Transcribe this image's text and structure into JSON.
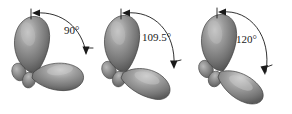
{
  "figure": {
    "background_color": "#ffffff",
    "lobe_color_mid": "#8a8a8a",
    "lobe_color_light": "#c4c4c4",
    "lobe_color_dark": "#5a5a5a",
    "outline_color": "#3a3a3a",
    "arc_color": "#1a1a1a"
  },
  "panels": [
    {
      "id": "panel-90",
      "angle_label": "90°",
      "angle_value": 90,
      "orbital_count": 2,
      "arc_start_marker": "tick-with-arrowhead",
      "arc_end_marker": "tick-with-arrowhead"
    },
    {
      "id": "panel-109-5",
      "angle_label": "109.5°",
      "angle_value": 109.5,
      "orbital_count": 2,
      "arc_start_marker": "tick-with-arrowhead",
      "arc_end_marker": "tick-with-arrowhead"
    },
    {
      "id": "panel-120",
      "angle_label": "120°",
      "angle_value": 120,
      "orbital_count": 2,
      "arc_start_marker": "tick-with-arrowhead",
      "arc_end_marker": "tick-with-arrowhead"
    }
  ]
}
